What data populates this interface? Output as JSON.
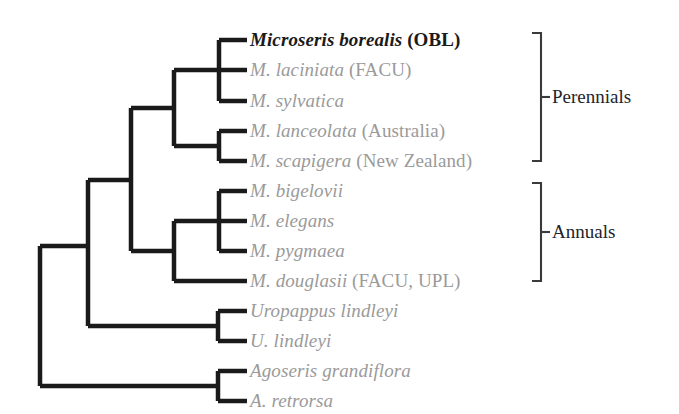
{
  "figure": {
    "type": "cladogram",
    "orientation": "left-to-right",
    "background_color": "#ffffff",
    "branch_color": "#1a1a1a",
    "default_text_color": "#9a9a9a",
    "highlight_text_color": "#1a1a1a",
    "bracket_color": "#3a3a3a"
  },
  "taxa": [
    {
      "id": "microseris-borealis",
      "name": "Microseris borealis",
      "annotation": " (OBL)",
      "highlighted": true,
      "group": "Perennials"
    },
    {
      "id": "m-laciniata",
      "name": "M. laciniata",
      "annotation": " (FACU)",
      "highlighted": false,
      "group": "Perennials"
    },
    {
      "id": "m-sylvatica",
      "name": "M. sylvatica",
      "annotation": "",
      "highlighted": false,
      "group": "Perennials"
    },
    {
      "id": "m-lanceolata",
      "name": "M. lanceolata",
      "annotation": " (Australia)",
      "highlighted": false,
      "group": "Perennials"
    },
    {
      "id": "m-scapigera",
      "name": "M. scapigera",
      "annotation": " (New Zealand)",
      "highlighted": false,
      "group": "Perennials"
    },
    {
      "id": "m-bigelovii",
      "name": "M. bigelovii",
      "annotation": "",
      "highlighted": false,
      "group": "Annuals"
    },
    {
      "id": "m-elegans",
      "name": "M. elegans",
      "annotation": "",
      "highlighted": false,
      "group": "Annuals"
    },
    {
      "id": "m-pygmaea",
      "name": "M. pygmaea",
      "annotation": "",
      "highlighted": false,
      "group": "Annuals"
    },
    {
      "id": "m-douglasii",
      "name": "M. douglasii",
      "annotation": " (FACU, UPL)",
      "highlighted": false,
      "group": "Annuals"
    },
    {
      "id": "uropappus-lindleyi",
      "name": "Uropappus lindleyi",
      "annotation": "",
      "highlighted": false,
      "group": ""
    },
    {
      "id": "u-lindleyi",
      "name": "U. lindleyi",
      "annotation": "",
      "highlighted": false,
      "group": ""
    },
    {
      "id": "agoseris-grandiflora",
      "name": "Agoseris grandiflora",
      "annotation": "",
      "highlighted": false,
      "group": ""
    },
    {
      "id": "a-retrorsa",
      "name": "A. retrorsa",
      "annotation": "",
      "highlighted": false,
      "group": ""
    }
  ],
  "groups": [
    {
      "id": "perennials",
      "label": "Perennials",
      "first_taxon": "microseris-borealis",
      "last_taxon": "m-scapigera"
    },
    {
      "id": "annuals",
      "label": "Annuals",
      "first_taxon": "m-bigelovii",
      "last_taxon": "m-douglasii"
    }
  ],
  "topology": {
    "description": "Nested parentheses of the depicted cladogram",
    "newick": "(((((Microseris_borealis,M._laciniata,M._sylvatica),(M._lanceolata,M._scapigera)),((M._bigelovii,M._elegans,M._pygmaea),M._douglasii)),(Uropappus_lindleyi,U._lindleyi)),(Agoseris_grandiflora,A._retrorsa));"
  }
}
